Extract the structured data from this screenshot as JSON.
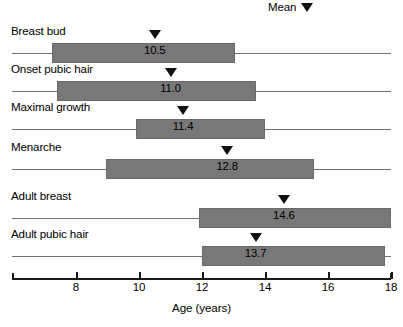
{
  "legend": {
    "label": "Mean",
    "marker_icon": "down-triangle-icon"
  },
  "chart_data": {
    "type": "bar",
    "title": "",
    "xlabel": "Age (years)",
    "ylabel": "",
    "xlim": [
      6.7,
      18.0
    ],
    "xticks": [
      8,
      10,
      12,
      14,
      16,
      18
    ],
    "xtick_labels": [
      "8",
      "10",
      "12",
      "14",
      "16",
      "18"
    ],
    "grid": false,
    "legend_position": "top-right",
    "orientation": "horizontal",
    "bar_color": "#787878",
    "marker_color": "#111111",
    "categories": [
      "Breast bud",
      "Onset pubic hair",
      "Maximal growth",
      "Menarche",
      "Adult breast",
      "Adult pubic hair"
    ],
    "ranges": [
      [
        7.25,
        13.05
      ],
      [
        7.4,
        13.7
      ],
      [
        9.9,
        14.0
      ],
      [
        8.95,
        15.55
      ],
      [
        11.9,
        18.0
      ],
      [
        12.0,
        17.8
      ]
    ],
    "means": [
      10.5,
      11.0,
      11.4,
      12.8,
      14.6,
      13.7
    ],
    "mean_labels": [
      "10.5",
      "11.0",
      "11.4",
      "12.8",
      "14.6",
      "13.7"
    ],
    "series": [
      {
        "name": "Breast bud",
        "start": 7.25,
        "end": 13.05,
        "mean": 10.5,
        "mean_label": "10.5"
      },
      {
        "name": "Onset pubic hair",
        "start": 7.4,
        "end": 13.7,
        "mean": 11.0,
        "mean_label": "11.0"
      },
      {
        "name": "Maximal growth",
        "start": 9.9,
        "end": 14.0,
        "mean": 11.4,
        "mean_label": "11.4"
      },
      {
        "name": "Menarche",
        "start": 8.95,
        "end": 15.55,
        "mean": 12.8,
        "mean_label": "12.8"
      },
      {
        "name": "Adult breast",
        "start": 11.9,
        "end": 18.0,
        "mean": 14.6,
        "mean_label": "14.6"
      },
      {
        "name": "Adult pubic hair",
        "start": 12.0,
        "end": 17.8,
        "mean": 13.7,
        "mean_label": "13.7"
      }
    ]
  }
}
